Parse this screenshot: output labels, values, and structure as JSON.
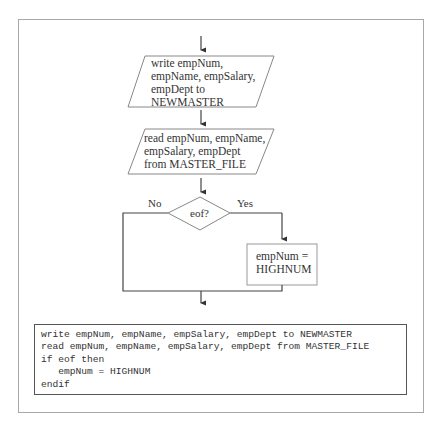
{
  "flowchart": {
    "write_step": {
      "lines": [
        "write empNum,",
        "empName, empSalary,",
        "empDept to",
        "NEWMASTER"
      ]
    },
    "read_step": {
      "lines": [
        "read empNum, empName,",
        "empSalary, empDept",
        "from MASTER_FILE"
      ]
    },
    "decision": {
      "label": "eof?",
      "no_label": "No",
      "yes_label": "Yes"
    },
    "assign_step": {
      "lines": [
        "empNum =",
        "HIGHNUM"
      ]
    }
  },
  "pseudocode": {
    "lines": [
      "write empNum, empName, empSalary, empDept to NEWMASTER",
      "read empNum, empName, empSalary, empDept from MASTER_FILE",
      "if eof then",
      "   empNum = HIGHNUM",
      "endif"
    ]
  },
  "colors": {
    "line": "#555555",
    "shape_border": "#888888",
    "frame_border": "#a8a8a8"
  }
}
